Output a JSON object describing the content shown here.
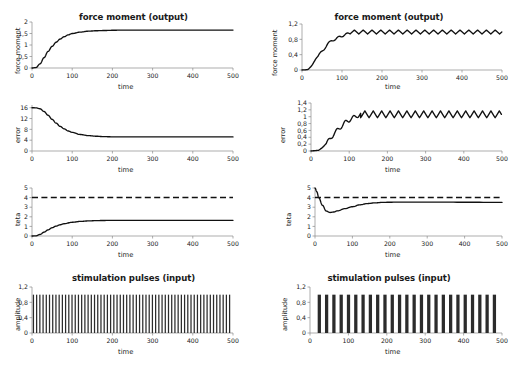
{
  "figure": {
    "background": "#ffffff",
    "line_color": "#111111",
    "axis_color": "#8a8a8a",
    "columns": 2,
    "rows": 4
  },
  "chart_data": [
    {
      "id": "left-force-moment",
      "type": "line",
      "title": "force moment (output)",
      "xlabel": "time",
      "ylabel": "force moment",
      "xlim": [
        0,
        500
      ],
      "ylim": [
        0,
        2
      ],
      "xticks": [
        0,
        100,
        200,
        300,
        400,
        500
      ],
      "xticklabels": [
        "0",
        "100",
        "200",
        "300",
        "400",
        "500"
      ],
      "yticks": [
        0,
        0.5,
        1,
        1.5,
        2
      ],
      "yticklabels": [
        "0",
        "0,5",
        "1",
        "1,5",
        "2"
      ],
      "grid": false,
      "legend": "none",
      "series": [
        {
          "name": "force moment",
          "style": "solid",
          "x": [
            0,
            10,
            20,
            30,
            40,
            50,
            60,
            70,
            80,
            90,
            100,
            120,
            140,
            160,
            180,
            200,
            220,
            240,
            260,
            300,
            350,
            400,
            450,
            500
          ],
          "values": [
            0,
            0.02,
            0.18,
            0.45,
            0.72,
            0.94,
            1.12,
            1.26,
            1.36,
            1.44,
            1.5,
            1.56,
            1.6,
            1.62,
            1.63,
            1.64,
            1.645,
            1.65,
            1.65,
            1.65,
            1.65,
            1.65,
            1.65,
            1.65
          ]
        }
      ]
    },
    {
      "id": "left-error",
      "type": "line",
      "title": "",
      "xlabel": "time",
      "ylabel": "error",
      "xlim": [
        0,
        500
      ],
      "ylim": [
        0,
        17
      ],
      "xticks": [
        0,
        100,
        200,
        300,
        400,
        500
      ],
      "xticklabels": [
        "0",
        "100",
        "200",
        "300",
        "400",
        "500"
      ],
      "yticks": [
        0,
        4,
        8,
        12,
        16
      ],
      "yticklabels": [
        "0",
        "4",
        "8",
        "12",
        "16"
      ],
      "grid": false,
      "legend": "none",
      "series": [
        {
          "name": "error",
          "style": "solid",
          "x": [
            0,
            10,
            20,
            30,
            40,
            50,
            60,
            70,
            80,
            90,
            100,
            120,
            140,
            160,
            180,
            200,
            240,
            300,
            360,
            420,
            500
          ],
          "values": [
            16,
            15.95,
            15.6,
            14.6,
            13.2,
            11.7,
            10.3,
            9.1,
            8.2,
            7.4,
            6.9,
            6.1,
            5.7,
            5.45,
            5.3,
            5.24,
            5.2,
            5.2,
            5.2,
            5.2,
            5.2
          ]
        }
      ]
    },
    {
      "id": "left-teta",
      "type": "line",
      "title": "",
      "xlabel": "time",
      "ylabel": "teta",
      "xlim": [
        0,
        500
      ],
      "ylim": [
        0,
        5
      ],
      "xticks": [
        0,
        100,
        200,
        300,
        400,
        500
      ],
      "xticklabels": [
        "0",
        "100",
        "200",
        "300",
        "400",
        "500"
      ],
      "yticks": [
        0,
        1,
        2,
        3,
        4,
        5
      ],
      "yticklabels": [
        "0",
        "1",
        "2",
        "3",
        "4",
        "5"
      ],
      "grid": false,
      "legend": "none",
      "series": [
        {
          "name": "setpoint",
          "style": "dashed",
          "x": [
            0,
            500
          ],
          "values": [
            4,
            4
          ]
        },
        {
          "name": "teta",
          "style": "solid",
          "x": [
            0,
            10,
            20,
            30,
            40,
            50,
            60,
            70,
            80,
            100,
            120,
            140,
            160,
            180,
            200,
            250,
            300,
            400,
            500
          ],
          "values": [
            0,
            0.02,
            0.16,
            0.4,
            0.64,
            0.86,
            1.03,
            1.17,
            1.28,
            1.43,
            1.52,
            1.57,
            1.6,
            1.62,
            1.63,
            1.63,
            1.63,
            1.63,
            1.63
          ]
        }
      ]
    },
    {
      "id": "left-stimulation-pulses",
      "type": "bar",
      "title": "stimulation pulses (input)",
      "xlabel": "time",
      "ylabel": "amplitude",
      "xlim": [
        0,
        500
      ],
      "ylim": [
        0,
        1.2
      ],
      "xticks": [
        0,
        100,
        200,
        300,
        400,
        500
      ],
      "xticklabels": [
        "0",
        "100",
        "200",
        "300",
        "400",
        "500"
      ],
      "yticks": [
        0,
        0.4,
        0.8,
        1.2
      ],
      "yticklabels": [
        "0",
        "0,4",
        "0,8",
        "1,2"
      ],
      "grid": false,
      "legend": "none",
      "pulse_amplitude": 1.0,
      "pulse_count": 62,
      "pulse_period": 8,
      "pulse_width": 3.1,
      "pulse_start": 2,
      "description": "dense regular pulse train from t=0 to t=500"
    },
    {
      "id": "right-force-moment",
      "type": "line",
      "title": "force moment (output)",
      "xlabel": "time",
      "ylabel": "force moment",
      "xlim": [
        0,
        500
      ],
      "ylim": [
        0,
        1.2
      ],
      "xticks": [
        0,
        100,
        200,
        300,
        400,
        500
      ],
      "xticklabels": [
        "0",
        "100",
        "200",
        "300",
        "400",
        "500"
      ],
      "yticks": [
        0,
        0.4,
        0.8,
        1.2
      ],
      "yticklabels": [
        "0",
        "0,4",
        "0,8",
        "1,2"
      ],
      "grid": false,
      "legend": "none",
      "series": [
        {
          "name": "force moment",
          "style": "solid-ripple",
          "rise_end": 120,
          "steady_level": 0.99,
          "ripple_amplitude": 0.05,
          "ripple_period": 22,
          "x": [
            0,
            15,
            25,
            35,
            45,
            55,
            65,
            75,
            85,
            95,
            105,
            115,
            125,
            500
          ],
          "values": [
            0,
            0.01,
            0.12,
            0.3,
            0.42,
            0.55,
            0.68,
            0.78,
            0.8,
            0.88,
            0.9,
            0.95,
            0.99,
            0.99
          ]
        }
      ]
    },
    {
      "id": "right-error",
      "type": "line",
      "title": "",
      "xlabel": "time",
      "ylabel": "error",
      "xlim": [
        0,
        500
      ],
      "ylim": [
        0,
        1.4
      ],
      "xticks": [
        0,
        100,
        200,
        300,
        400,
        500
      ],
      "xticklabels": [
        "0",
        "100",
        "200",
        "300",
        "400",
        "500"
      ],
      "yticks": [
        0,
        0.2,
        0.4,
        0.6,
        0.8,
        1,
        1.2,
        1.4
      ],
      "yticklabels": [
        "0",
        "0,2",
        "0,4",
        "0,6",
        "0,8",
        "1",
        "1,2",
        "1,4"
      ],
      "grid": false,
      "legend": "none",
      "series": [
        {
          "name": "error",
          "style": "solid-ripple",
          "rise_end": 130,
          "steady_level": 1.07,
          "ripple_amplitude": 0.1,
          "ripple_period": 22,
          "x": [
            0,
            20,
            30,
            40,
            50,
            60,
            70,
            80,
            90,
            100,
            110,
            120,
            130,
            500
          ],
          "values": [
            0,
            0.02,
            0.1,
            0.22,
            0.35,
            0.5,
            0.62,
            0.72,
            0.84,
            0.9,
            0.97,
            1.02,
            1.07,
            1.07
          ]
        }
      ]
    },
    {
      "id": "right-teta",
      "type": "line",
      "title": "",
      "xlabel": "time",
      "ylabel": "teta",
      "xlim": [
        0,
        500
      ],
      "ylim": [
        0,
        5
      ],
      "xticks": [
        0,
        100,
        200,
        300,
        400,
        500
      ],
      "xticklabels": [
        "0",
        "100",
        "200",
        "300",
        "400",
        "500"
      ],
      "yticks": [
        0,
        1,
        2,
        3,
        4,
        5
      ],
      "yticklabels": [
        "0",
        "1",
        "2",
        "3",
        "4",
        "5"
      ],
      "grid": false,
      "legend": "none",
      "series": [
        {
          "name": "setpoint",
          "style": "dashed",
          "x": [
            0,
            500
          ],
          "values": [
            4,
            4
          ]
        },
        {
          "name": "teta",
          "style": "solid",
          "x": [
            0,
            5,
            10,
            20,
            30,
            40,
            50,
            60,
            80,
            100,
            120,
            140,
            160,
            180,
            200,
            250,
            300,
            400,
            500
          ],
          "values": [
            5,
            4.6,
            4.0,
            3.2,
            2.6,
            2.45,
            2.5,
            2.62,
            2.85,
            3.05,
            3.25,
            3.38,
            3.45,
            3.5,
            3.52,
            3.53,
            3.53,
            3.52,
            3.5
          ]
        }
      ]
    },
    {
      "id": "right-stimulation-pulses",
      "type": "bar",
      "title": "stimulation pulses (input)",
      "xlabel": "time",
      "ylabel": "amplitude",
      "xlim": [
        0,
        500
      ],
      "ylim": [
        0,
        1.2
      ],
      "xticks": [
        0,
        100,
        200,
        300,
        400,
        500
      ],
      "xticklabels": [
        "0",
        "100",
        "200",
        "300",
        "400",
        "500"
      ],
      "yticks": [
        0,
        0.4,
        0.8,
        1.2
      ],
      "yticklabels": [
        "0",
        "0,4",
        "0,8",
        "1,2"
      ],
      "grid": false,
      "legend": "none",
      "pulse_amplitude": 1.0,
      "pulse_count": 25,
      "pulse_period": 19,
      "pulse_width": 8.5,
      "pulse_start": 20,
      "description": "sparser wide pulse train from t=20 to t=490"
    }
  ]
}
